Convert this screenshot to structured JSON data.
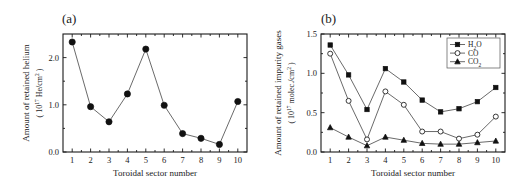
{
  "figure": {
    "panels": [
      {
        "label": "(a)",
        "chart_data": {
          "type": "line",
          "title": "",
          "xlabel": "Toroidal sector number",
          "ylabel_line1": "Amount of retained helium",
          "ylabel_line2": "( 10",
          "ylabel_exp": "17",
          "ylabel_line3": " He/cm",
          "ylabel_sup": "2",
          "ylabel_close": " )",
          "categories": [
            1,
            2,
            3,
            4,
            5,
            6,
            7,
            8,
            9,
            10
          ],
          "xticklabels": [
            "1",
            "2",
            "3",
            "4",
            "5",
            "6",
            "7",
            "8",
            "9",
            "10"
          ],
          "yticklabels": [
            "0.0",
            "1.0",
            "2.0"
          ],
          "ytickvalues": [
            0.0,
            1.0,
            2.0
          ],
          "yminorvalues": [
            0.5,
            1.5
          ],
          "xlim": [
            0.5,
            10.5
          ],
          "ylim": [
            0.0,
            2.5
          ],
          "grid": false,
          "legend": "none",
          "series": [
            {
              "name": "retained helium",
              "marker": "filled-circle",
              "values": [
                2.33,
                0.96,
                0.64,
                1.23,
                2.18,
                0.99,
                0.39,
                0.29,
                0.16,
                1.07
              ]
            }
          ]
        }
      },
      {
        "label": "(b)",
        "chart_data": {
          "type": "line",
          "title": "",
          "xlabel": "Toroidal sector number",
          "ylabel_line1": "Amount of retained impurity gases",
          "ylabel_line2": "( 10",
          "ylabel_exp": "17",
          "ylabel_line3": " molec./cm",
          "ylabel_sup": "2",
          "ylabel_close": " )",
          "categories": [
            1,
            2,
            3,
            4,
            5,
            6,
            7,
            8,
            9,
            10
          ],
          "xticklabels": [
            "1",
            "2",
            "3",
            "4",
            "5",
            "6",
            "7",
            "8",
            "9",
            "10"
          ],
          "yticklabels": [
            "0.0",
            "0.5",
            "1.0",
            "1.5"
          ],
          "ytickvalues": [
            0.0,
            0.5,
            1.0,
            1.5
          ],
          "yminorvalues": [
            0.25,
            0.75,
            1.25
          ],
          "xlim": [
            0.5,
            10.5
          ],
          "ylim": [
            0.0,
            1.5
          ],
          "grid": false,
          "legend": "upper right",
          "series": [
            {
              "name": "H2O",
              "name_base": "H",
              "name_sub": "2",
              "name_tail": "O",
              "marker": "filled-square",
              "values": [
                1.36,
                0.98,
                0.54,
                1.06,
                0.89,
                0.66,
                0.51,
                0.55,
                0.64,
                0.82
              ]
            },
            {
              "name": "CO",
              "name_base": "CO",
              "name_sub": "",
              "name_tail": "",
              "marker": "open-circle",
              "values": [
                1.25,
                0.65,
                0.16,
                0.77,
                0.6,
                0.26,
                0.26,
                0.17,
                0.22,
                0.45
              ]
            },
            {
              "name": "CO2",
              "name_base": "CO",
              "name_sub": "2",
              "name_tail": "",
              "marker": "filled-triangle",
              "values": [
                0.31,
                0.19,
                0.08,
                0.19,
                0.15,
                0.11,
                0.1,
                0.1,
                0.12,
                0.14
              ]
            }
          ]
        }
      }
    ]
  }
}
